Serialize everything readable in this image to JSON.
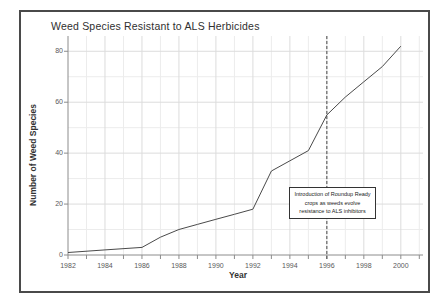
{
  "figure": {
    "title": "Weed Species Resistant to ALS Herbicides"
  },
  "chart_data": {
    "type": "line",
    "title": "Weed Species Resistant to ALS Herbicides",
    "xlabel": "Year",
    "ylabel": "Number of Weed Species",
    "x": [
      1982,
      1984,
      1986,
      1987,
      1988,
      1989,
      1990,
      1991,
      1992,
      1993,
      1994,
      1995,
      1996,
      1997,
      1998,
      1999,
      2000
    ],
    "values": [
      1,
      2,
      3,
      7,
      10,
      12,
      14,
      16,
      18,
      33,
      37,
      41,
      55,
      62,
      68,
      74,
      82
    ],
    "xlim": [
      1982,
      2001.2
    ],
    "ylim": [
      0,
      86
    ],
    "x_ticks": [
      1982,
      1984,
      1986,
      1988,
      1990,
      1992,
      1994,
      1996,
      1998,
      2000
    ],
    "x_minor_step": 1,
    "y_ticks": [
      0,
      20,
      40,
      60,
      80
    ],
    "y_minor_step": 10,
    "grid": true,
    "legend": "none",
    "line_color": "#4a4a4a",
    "axis_color": "#8c8c8c",
    "grid_major_color": "#dcdcdc",
    "grid_minor_color": "#ececec",
    "annotation": {
      "line_x": 1996,
      "line_style": "dashed",
      "text_lines": [
        "Introduction of Roundup Ready",
        "crops as weeds evolve",
        "resistance to ALS inhibitors"
      ]
    }
  }
}
